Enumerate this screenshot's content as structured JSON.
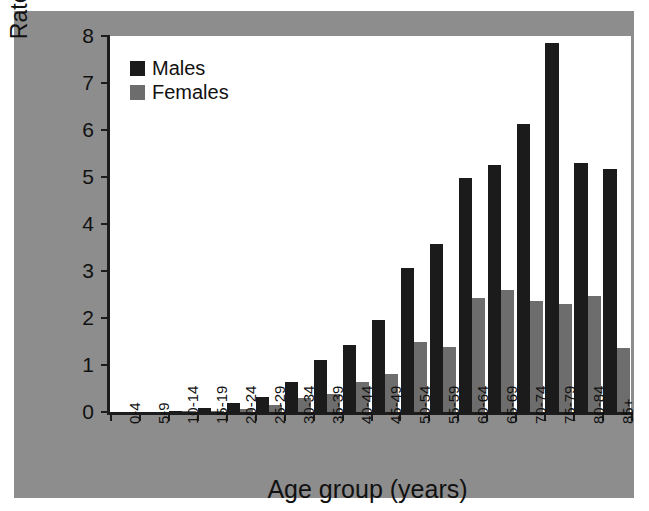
{
  "chart_data": {
    "type": "bar",
    "title": "",
    "subtitle": "",
    "xlabel": "Age group (years)",
    "ylabel": "Rate per 100,000 population",
    "ylim": [
      0,
      8
    ],
    "yticks": [
      0,
      1,
      2,
      3,
      4,
      5,
      6,
      7,
      8
    ],
    "grid": false,
    "legend_position": "top-left",
    "categories": [
      "0-4",
      "5-9",
      "10-14",
      "15-19",
      "20-24",
      "25-29",
      "30-34",
      "35-39",
      "40-44",
      "45-49",
      "50-54",
      "55-59",
      "60-64",
      "65-69",
      "70-74",
      "75-79",
      "80-84",
      "85+"
    ],
    "series": [
      {
        "name": "Males",
        "color": "#1b1b1b",
        "values": [
          0,
          0,
          0.02,
          0.09,
          0.2,
          0.33,
          0.63,
          1.1,
          1.42,
          1.96,
          3.06,
          3.57,
          4.98,
          5.26,
          6.12,
          7.85,
          5.3,
          5.18
        ]
      },
      {
        "name": "Females",
        "color": "#6d6d6d",
        "values": [
          0,
          0,
          0.01,
          0.03,
          0.07,
          0.15,
          0.3,
          0.38,
          0.63,
          0.8,
          1.48,
          1.38,
          2.43,
          2.6,
          2.37,
          2.3,
          2.46,
          1.37
        ]
      }
    ]
  },
  "legend": {
    "items": [
      {
        "label": "Males",
        "swatch": "male"
      },
      {
        "label": "Females",
        "swatch": "female"
      }
    ]
  },
  "colors": {
    "male_bar": "#1b1b1b",
    "female_bar": "#6d6d6d",
    "panel_background": "#8d8d8d",
    "plot_background": "#ffffff",
    "axis": "#1c1c1c"
  }
}
